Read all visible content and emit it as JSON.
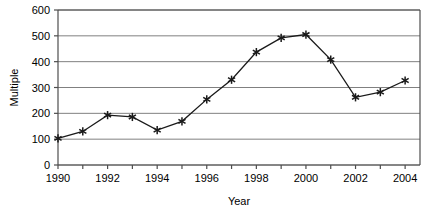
{
  "chart_data": {
    "type": "line",
    "title": "",
    "xlabel": "Year",
    "ylabel": "Multiple",
    "x": [
      1990,
      1991,
      1992,
      1993,
      1994,
      1995,
      1996,
      1997,
      1998,
      1999,
      2000,
      2001,
      2002,
      2003,
      2004
    ],
    "values": [
      103,
      130,
      193,
      186,
      135,
      169,
      254,
      330,
      437,
      492,
      505,
      408,
      262,
      282,
      327
    ],
    "series": [
      {
        "name": "Multiple",
        "values": [
          103,
          130,
          193,
          186,
          135,
          169,
          254,
          330,
          437,
          492,
          505,
          408,
          262,
          282,
          327
        ]
      }
    ],
    "xlim": [
      1990,
      2004.6
    ],
    "ylim": [
      0,
      600
    ],
    "ytick_labels": [
      "0",
      "100",
      "200",
      "300",
      "400",
      "500",
      "600"
    ],
    "ytick_values": [
      0,
      100,
      200,
      300,
      400,
      500,
      600
    ],
    "xtick_labels": [
      "1990",
      "1992",
      "1994",
      "1996",
      "1998",
      "2000",
      "2002",
      "2004"
    ],
    "xtick_values": [
      1990,
      1992,
      1994,
      1996,
      1998,
      2000,
      2002,
      2004
    ],
    "grid": "horizontal",
    "legend": "none",
    "marker": "asterisk",
    "line_color": "#1a1a1a",
    "grid_color": "#808080",
    "axis_color": "#4d4d4d",
    "background": "#ffffff"
  }
}
